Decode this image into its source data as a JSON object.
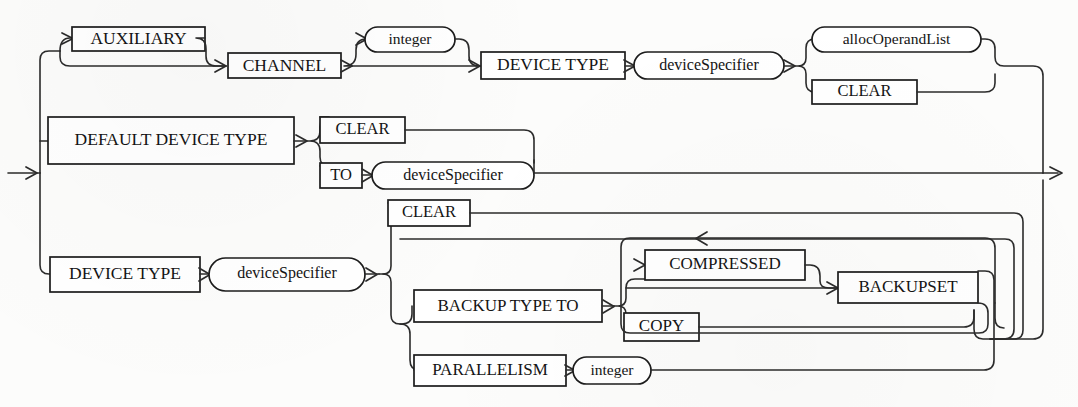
{
  "diagram": {
    "kind": "railroad-syntax-diagram",
    "entry_label": "entry-arrow",
    "exit_label": "exit-arrow",
    "stroke_color": "#1c1c1c",
    "background_color": "#fcfcfb",
    "nodes": {
      "auxiliary": "AUXILIARY",
      "channel": "CHANNEL",
      "integer_top": "integer",
      "device_type_top": "DEVICE TYPE",
      "device_specifier_top": "deviceSpecifier",
      "alloc_operand_list": "allocOperandList",
      "clear_top": "CLEAR",
      "default_device_type": "DEFAULT DEVICE TYPE",
      "clear_mid": "CLEAR",
      "to": "TO",
      "device_specifier_mid": "deviceSpecifier",
      "device_type_bottom": "DEVICE TYPE",
      "device_specifier_bottom": "deviceSpecifier",
      "clear_bottom": "CLEAR",
      "backup_type_to": "BACKUP TYPE TO",
      "compressed": "COMPRESSED",
      "copy": "COPY",
      "backupset": "BACKUPSET",
      "parallelism": "PARALLELISM",
      "integer_bottom": "integer"
    },
    "branches": [
      {
        "name": "auxiliary-channel-branch",
        "items": [
          "AUXILIARY",
          "CHANNEL",
          "integer",
          "DEVICE TYPE",
          "deviceSpecifier",
          "allocOperandList",
          "CLEAR"
        ]
      },
      {
        "name": "default-device-type-branch",
        "items": [
          "DEFAULT DEVICE TYPE",
          "CLEAR",
          "TO",
          "deviceSpecifier"
        ]
      },
      {
        "name": "device-type-branch",
        "items": [
          "DEVICE TYPE",
          "deviceSpecifier",
          "CLEAR",
          "BACKUP TYPE TO",
          "COMPRESSED",
          "COPY",
          "BACKUPSET",
          "PARALLELISM",
          "integer"
        ]
      }
    ]
  }
}
